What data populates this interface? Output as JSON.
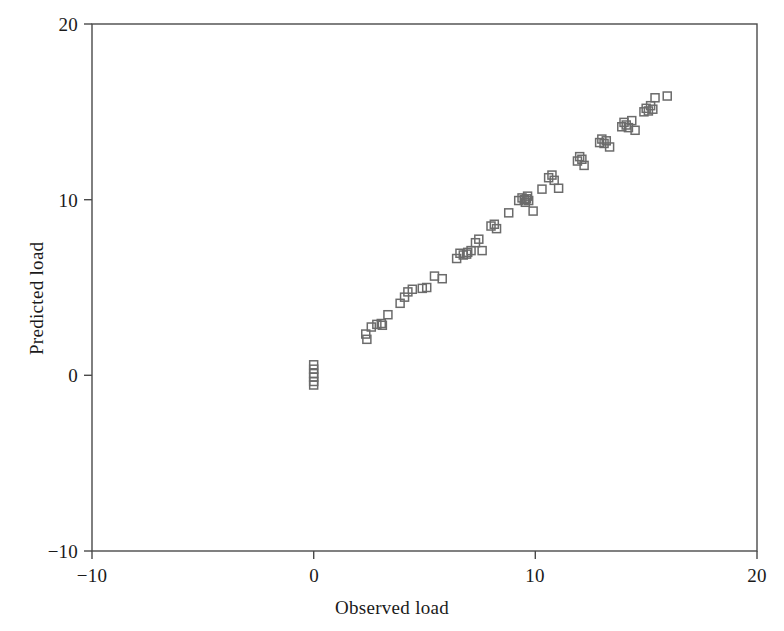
{
  "chart_data": {
    "type": "scatter",
    "title": "",
    "xlabel": "Observed load",
    "ylabel": "Predicted load",
    "xlim": [
      -10,
      20
    ],
    "ylim": [
      -10,
      20
    ],
    "xticks": [
      -10,
      0,
      10,
      20
    ],
    "yticks": [
      -10,
      0,
      10,
      20
    ],
    "xtick_labels": [
      "−10",
      "0",
      "10",
      "20"
    ],
    "ytick_labels": [
      "−10",
      "0",
      "10",
      "20"
    ],
    "grid": false,
    "legend": null,
    "marker": "open-square",
    "marker_color": "#6b6b6b",
    "marker_size": 8,
    "frame_color": "#4a4a4a",
    "background": "#ffffff",
    "series": [
      {
        "name": "observations",
        "points": [
          [
            0.0,
            0.6
          ],
          [
            0.0,
            0.35
          ],
          [
            0.0,
            0.1
          ],
          [
            0.0,
            -0.1
          ],
          [
            0.0,
            -0.35
          ],
          [
            0.0,
            -0.55
          ],
          [
            2.35,
            2.35
          ],
          [
            2.4,
            2.05
          ],
          [
            2.6,
            2.75
          ],
          [
            2.85,
            2.9
          ],
          [
            3.05,
            2.95
          ],
          [
            3.1,
            2.85
          ],
          [
            3.35,
            3.45
          ],
          [
            3.9,
            4.1
          ],
          [
            4.1,
            4.45
          ],
          [
            4.25,
            4.75
          ],
          [
            4.45,
            4.9
          ],
          [
            4.9,
            4.95
          ],
          [
            5.1,
            5.0
          ],
          [
            5.45,
            5.65
          ],
          [
            5.8,
            5.5
          ],
          [
            6.45,
            6.65
          ],
          [
            6.6,
            6.95
          ],
          [
            6.75,
            6.85
          ],
          [
            6.9,
            6.9
          ],
          [
            6.95,
            7.0
          ],
          [
            7.1,
            7.1
          ],
          [
            7.3,
            7.55
          ],
          [
            7.45,
            7.75
          ],
          [
            7.6,
            7.1
          ],
          [
            8.0,
            8.5
          ],
          [
            8.15,
            8.6
          ],
          [
            8.25,
            8.35
          ],
          [
            8.8,
            9.25
          ],
          [
            9.25,
            9.95
          ],
          [
            9.4,
            10.1
          ],
          [
            9.5,
            10.0
          ],
          [
            9.55,
            9.85
          ],
          [
            9.6,
            10.05
          ],
          [
            9.65,
            10.2
          ],
          [
            9.7,
            9.95
          ],
          [
            9.9,
            9.35
          ],
          [
            10.3,
            10.6
          ],
          [
            10.6,
            11.25
          ],
          [
            10.75,
            11.4
          ],
          [
            10.85,
            11.1
          ],
          [
            11.05,
            10.65
          ],
          [
            11.9,
            12.2
          ],
          [
            12.0,
            12.45
          ],
          [
            12.1,
            12.3
          ],
          [
            12.2,
            11.95
          ],
          [
            12.9,
            13.25
          ],
          [
            13.0,
            13.45
          ],
          [
            13.1,
            13.2
          ],
          [
            13.2,
            13.35
          ],
          [
            13.35,
            13.0
          ],
          [
            13.9,
            14.15
          ],
          [
            14.0,
            14.4
          ],
          [
            14.1,
            14.25
          ],
          [
            14.2,
            14.1
          ],
          [
            14.35,
            14.5
          ],
          [
            14.5,
            13.95
          ],
          [
            14.9,
            15.0
          ],
          [
            15.0,
            15.2
          ],
          [
            15.1,
            15.05
          ],
          [
            15.2,
            15.35
          ],
          [
            15.3,
            15.15
          ],
          [
            15.4,
            15.8
          ],
          [
            15.95,
            15.9
          ]
        ]
      }
    ]
  },
  "axes": {
    "x_title": "Observed load",
    "y_title": "Predicted load",
    "x_ticks": [
      "−10",
      "0",
      "10",
      "20"
    ],
    "y_ticks": [
      "20",
      "10",
      "0",
      "−10"
    ]
  }
}
